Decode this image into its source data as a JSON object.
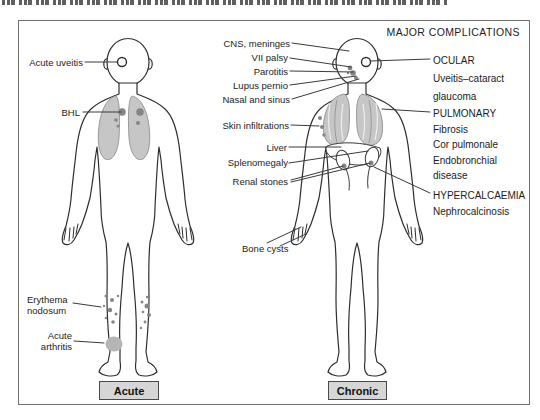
{
  "figure": {
    "header": "MAJOR COMPLICATIONS",
    "acute": {
      "caption": "Acute",
      "uveitis": "Acute uveitis",
      "bhl": "BHL",
      "erythema1": "Erythema",
      "erythema2": "nodosum",
      "arthritis1": "Acute",
      "arthritis2": "arthritis"
    },
    "chronic": {
      "caption": "Chronic",
      "cns": "CNS, meninges",
      "vii_palsy": "VII palsy",
      "parotitis": "Parotitis",
      "lupus_pernio": "Lupus pernio",
      "nasal_sinus": "Nasal and sinus",
      "skin": "Skin infiltrations",
      "liver": "Liver",
      "splenomegaly": "Splenomegaly",
      "renal_stones": "Renal stones",
      "bone_cysts": "Bone cysts"
    },
    "complications": {
      "ocular": {
        "title": "OCULAR",
        "line1": "Uveitis–cataract",
        "line2": "glaucoma"
      },
      "pulmonary": {
        "title": "PULMONARY",
        "line1": "Fibrosis",
        "line2": "Cor pulmonale",
        "line3": "Endobronchial",
        "line4": "disease"
      },
      "hypercalcaemia": {
        "title": "HYPERCALCAEMIA",
        "line1": "Nephrocalcinosis"
      }
    },
    "colors": {
      "lung_fill": "#c6c6c6",
      "lung_stroke": "#8e8e8e",
      "node_fill": "#858585",
      "caption_bg": "#d6d6d6",
      "outline": "#2e2e2e",
      "leader": "#3a3a3a",
      "band_fill": "#b5b5b5",
      "text": "#1c1c1c"
    }
  }
}
